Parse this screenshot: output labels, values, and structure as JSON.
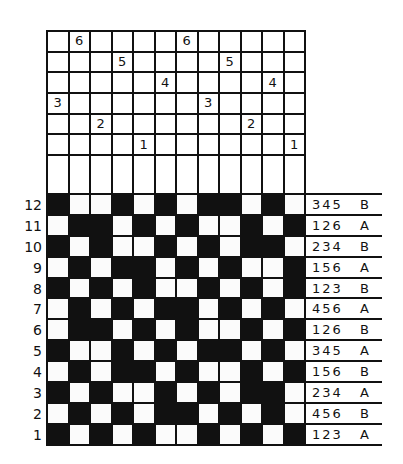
{
  "threading": {
    "columns": 12,
    "rows": [
      {
        "shaft": 6,
        "marks": {
          "2": "6",
          "7": "6"
        }
      },
      {
        "shaft": 5,
        "marks": {
          "4": "5",
          "9": "5"
        }
      },
      {
        "shaft": 4,
        "marks": {
          "6": "4",
          "11": "4"
        }
      },
      {
        "shaft": 3,
        "marks": {
          "1": "3",
          "8": "3"
        }
      },
      {
        "shaft": 2,
        "marks": {
          "3": "2",
          "10": "2"
        }
      },
      {
        "shaft": 1,
        "marks": {
          "5": "1",
          "12": "1"
        }
      }
    ]
  },
  "weave": {
    "colors": {
      "black": "#111111",
      "white": "#fbfbfb"
    },
    "rows": [
      {
        "number": "12",
        "cells": "BWWBWBWBBWBW",
        "lift": "345",
        "treadle": "B"
      },
      {
        "number": "11",
        "cells": "WBBWBWBWWBWB",
        "lift": "126",
        "treadle": "A"
      },
      {
        "number": "10",
        "cells": "BWBWWBWBWBBW",
        "lift": "234",
        "treadle": "B"
      },
      {
        "number": "9",
        "cells": "WBWBBWBWBWWB",
        "lift": "156",
        "treadle": "A"
      },
      {
        "number": "8",
        "cells": "BWBWBWWBWBWB",
        "lift": "123",
        "treadle": "B"
      },
      {
        "number": "7",
        "cells": "WBWBWBBWBWBW",
        "lift": "456",
        "treadle": "A"
      },
      {
        "number": "6",
        "cells": "WBBWBWBWWBWB",
        "lift": "126",
        "treadle": "B"
      },
      {
        "number": "5",
        "cells": "BWWBWBWBBWBW",
        "lift": "345",
        "treadle": "A"
      },
      {
        "number": "4",
        "cells": "WBWBBWBWWBWB",
        "lift": "156",
        "treadle": "B"
      },
      {
        "number": "3",
        "cells": "BWBWWBWBWBBW",
        "lift": "234",
        "treadle": "A"
      },
      {
        "number": "2",
        "cells": "WBWBWBBWBWBW",
        "lift": "456",
        "treadle": "B"
      },
      {
        "number": "1",
        "cells": "BWBWBWWBWBWB",
        "lift": "123",
        "treadle": "A"
      }
    ]
  }
}
